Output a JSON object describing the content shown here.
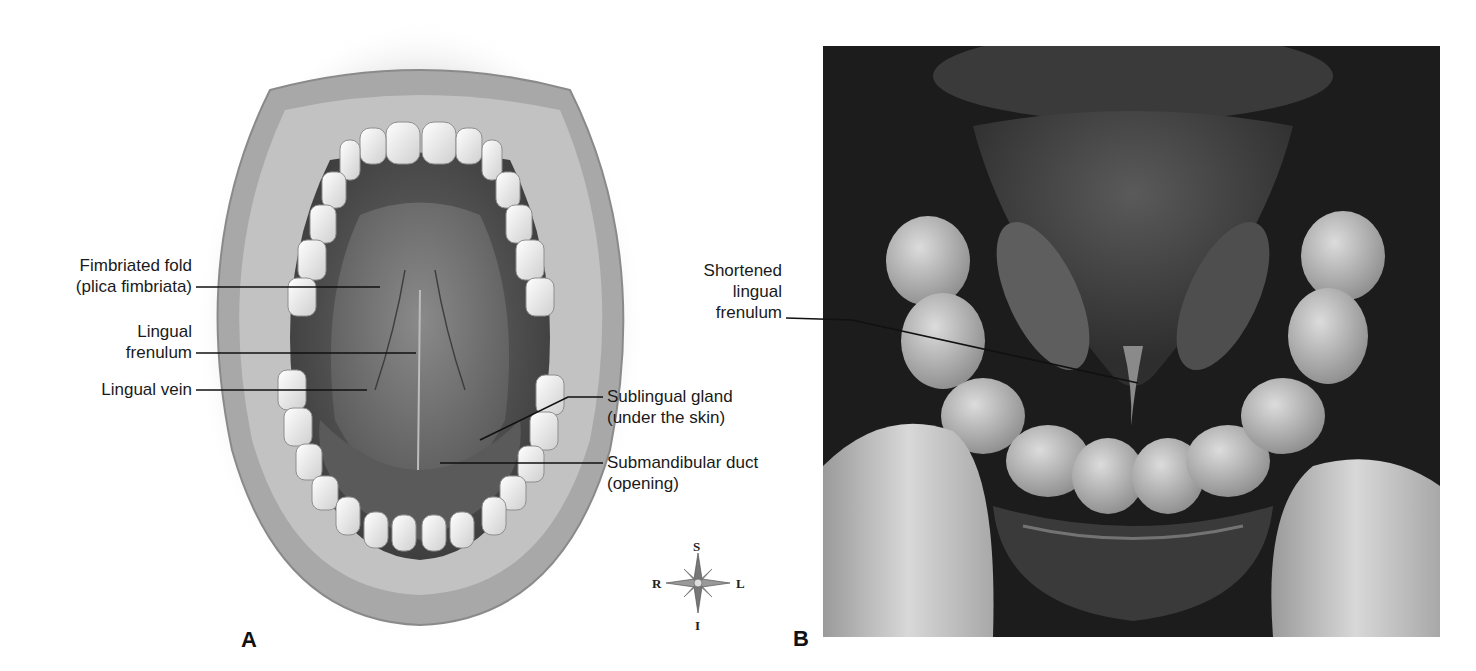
{
  "figure": {
    "panel_a": {
      "letter": "A",
      "description": "Illustration of open mouth with tongue raised showing underside",
      "labels": {
        "fimbriated_fold": [
          "Fimbriated fold",
          "(plica fimbriata)"
        ],
        "lingual_frenulum": [
          "Lingual",
          "frenulum"
        ],
        "lingual_vein": [
          "Lingual vein"
        ],
        "sublingual_gland": [
          "Sublingual gland",
          "(under the skin)"
        ],
        "submandibular_duct": [
          "Submandibular duct",
          "(opening)"
        ]
      }
    },
    "compass": {
      "superior": "S",
      "inferior": "I",
      "right": "R",
      "left": "L"
    },
    "panel_b": {
      "letter": "B",
      "description": "Photograph of tongue-tie with shortened lingual frenulum",
      "labels": {
        "shortened_frenulum": [
          "Shortened",
          "lingual",
          "frenulum"
        ]
      }
    }
  },
  "colors": {
    "background": "#ffffff",
    "text": "#1a1a1a",
    "leader_line": "#111111",
    "photo_dark": "#1b1b1b"
  }
}
